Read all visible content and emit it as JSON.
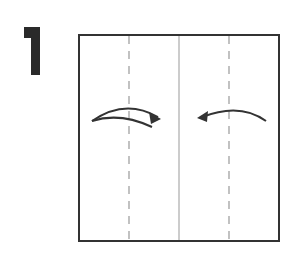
{
  "step": {
    "number": "1",
    "number_color": "#2a2a2a"
  },
  "diagram": {
    "type": "origami-fold-step",
    "paper": {
      "x": 79,
      "y": 35,
      "width": 200,
      "height": 206,
      "stroke": "#333333"
    },
    "center_line": {
      "x": 179,
      "style": "solid",
      "color": "#999999"
    },
    "fold_lines": [
      {
        "x": 129,
        "style": "dashed",
        "color": "#999999"
      },
      {
        "x": 229,
        "style": "dashed",
        "color": "#999999"
      }
    ],
    "arrows": [
      {
        "name": "left-flap-fold-arrow",
        "direction": "right",
        "description": "fold left edge to center"
      },
      {
        "name": "right-flap-fold-arrow",
        "direction": "left",
        "description": "fold right edge to center"
      }
    ]
  }
}
